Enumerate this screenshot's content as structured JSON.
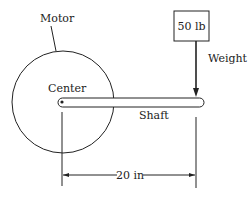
{
  "labels": {
    "motor": "Motor",
    "center": "Center",
    "shaft": "Shaft",
    "weight_value": "50 lb",
    "weight": "Weight",
    "distance": "20 in"
  },
  "colors": {
    "stroke": "#222222",
    "background": "#ffffff"
  }
}
